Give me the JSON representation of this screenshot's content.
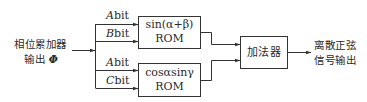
{
  "diagram": {
    "input": {
      "line1": "相位累加器",
      "line2_prefix": "输出 ",
      "line2_symbol": "Φ"
    },
    "bits": [
      {
        "var": "A",
        "suffix": "bit"
      },
      {
        "var": "B",
        "suffix": "bit"
      },
      {
        "var": "A",
        "suffix": "bit"
      },
      {
        "var": "C",
        "suffix": "bit"
      }
    ],
    "rom_top": {
      "line1": "sin(α+β)",
      "line2": "ROM"
    },
    "rom_bottom": {
      "line1": "cosαsinγ",
      "line2": "ROM"
    },
    "adder": {
      "label": "加法器"
    },
    "output": {
      "line1": "离散正弦",
      "line2": "信号输出"
    },
    "colors": {
      "line": "#333333",
      "text": "#2a2a2a",
      "background": "#ffffff"
    }
  }
}
